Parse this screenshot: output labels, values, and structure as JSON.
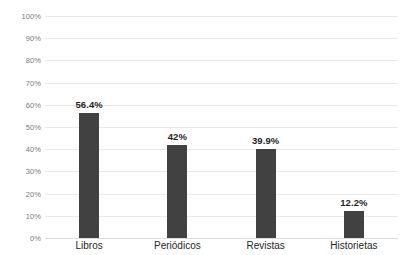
{
  "chart_data": {
    "type": "bar",
    "title": "",
    "subtitle": "",
    "xlabel": "",
    "ylabel": "",
    "categories": [
      "Libros",
      "Periódicos",
      "Revistas",
      "Historietas"
    ],
    "values": [
      56.4,
      42,
      39.9,
      12.2
    ],
    "data_labels": [
      "56.4%",
      "42%",
      "39.9%",
      "12.2%"
    ],
    "ylim": [
      0,
      100
    ],
    "ytick_values": [
      0,
      10,
      20,
      30,
      40,
      50,
      60,
      70,
      80,
      90,
      100
    ],
    "ytick_labels": [
      "0%",
      "10%",
      "20%",
      "30%",
      "40%",
      "50%",
      "60%",
      "70%",
      "80%",
      "90%",
      "100%"
    ],
    "grid": true,
    "grid_axis": "y",
    "legend": false,
    "legend_position": "none",
    "series": [
      {
        "name": "",
        "values": [
          56.4,
          42,
          39.9,
          12.2
        ]
      }
    ],
    "colors": {
      "bar": "#414141",
      "gridline": "#e9e9e9",
      "baseline": "#dcdcdc",
      "background": "#ffffff",
      "ytick_text": "#7b7b7b",
      "xtick_text": "#262626",
      "data_label_text": "#1f1f1f"
    }
  }
}
